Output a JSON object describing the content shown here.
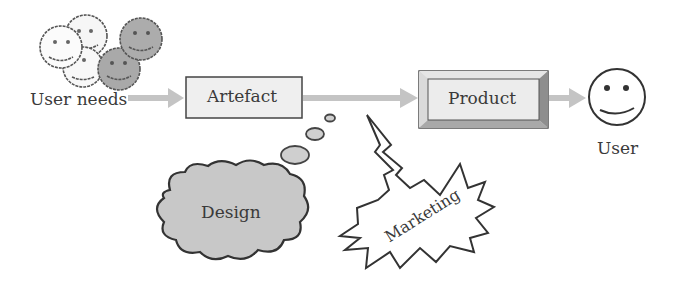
{
  "diagram": {
    "nodes": {
      "user_needs": {
        "label": "User needs",
        "icon": "group-of-smiley-faces-icon"
      },
      "artefact": {
        "label": "Artefact"
      },
      "product": {
        "label": "Product"
      },
      "user": {
        "label": "User",
        "icon": "smiley-face-icon"
      },
      "design": {
        "label": "Design",
        "shape": "thought-cloud"
      },
      "marketing": {
        "label": "Marketing",
        "shape": "starburst"
      }
    },
    "edges": [
      {
        "from": "User needs",
        "to": "Artefact"
      },
      {
        "from": "Artefact",
        "to": "Product"
      },
      {
        "from": "Product",
        "to": "User"
      }
    ],
    "colors": {
      "arrow": "#c4c4c4",
      "box_fill": "#efefef",
      "cloud_fill": "#c8c8c8",
      "gray_face": "#a9a9a9",
      "outline": "#333333"
    }
  }
}
